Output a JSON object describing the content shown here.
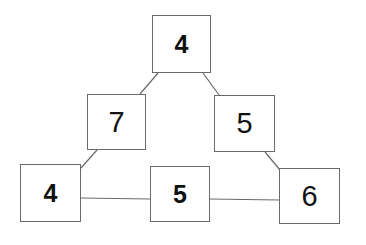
{
  "diagram": {
    "type": "number-triangle",
    "colors": {
      "border": "#6a6a6a",
      "text": "#111111",
      "background": "#ffffff"
    },
    "nodes": [
      {
        "id": "top",
        "value": "4",
        "weight": "bold",
        "x": 152,
        "y": 15,
        "w": 59,
        "h": 58
      },
      {
        "id": "mid-left",
        "value": "7",
        "weight": "regular",
        "x": 87,
        "y": 94,
        "w": 59,
        "h": 56
      },
      {
        "id": "mid-right",
        "value": "5",
        "weight": "regular",
        "x": 214,
        "y": 95,
        "w": 61,
        "h": 57
      },
      {
        "id": "bottom-left",
        "value": "4",
        "weight": "bold",
        "x": 20,
        "y": 164,
        "w": 61,
        "h": 58
      },
      {
        "id": "bottom-middle",
        "value": "5",
        "weight": "bold",
        "x": 150,
        "y": 166,
        "w": 60,
        "h": 56
      },
      {
        "id": "bottom-right",
        "value": "6",
        "weight": "regular",
        "x": 279,
        "y": 168,
        "w": 61,
        "h": 56
      }
    ],
    "edges": [
      {
        "from": "top",
        "to": "mid-left",
        "x1": 158,
        "y1": 73,
        "x2": 140,
        "y2": 94
      },
      {
        "from": "top",
        "to": "mid-right",
        "x1": 203,
        "y1": 73,
        "x2": 219,
        "y2": 95
      },
      {
        "from": "mid-left",
        "to": "bottom-left",
        "x1": 97,
        "y1": 150,
        "x2": 81,
        "y2": 168
      },
      {
        "from": "mid-right",
        "to": "bottom-right",
        "x1": 265,
        "y1": 152,
        "x2": 280,
        "y2": 170
      },
      {
        "from": "bottom-left",
        "to": "bottom-middle",
        "x1": 81,
        "y1": 198,
        "x2": 150,
        "y2": 199
      },
      {
        "from": "bottom-middle",
        "to": "bottom-right",
        "x1": 210,
        "y1": 199,
        "x2": 279,
        "y2": 200
      }
    ]
  }
}
